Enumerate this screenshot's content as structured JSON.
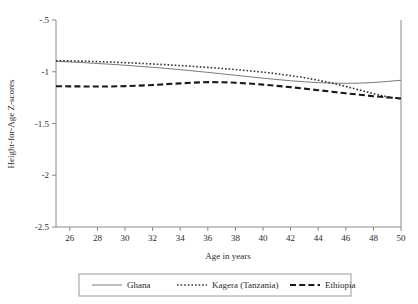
{
  "chart_data": {
    "type": "line",
    "title": "",
    "xlabel": "Age in years",
    "ylabel": "Height-for-Age Z-scores",
    "xlim": [
      25,
      50
    ],
    "ylim": [
      -2.5,
      -0.5
    ],
    "xticks": [
      26,
      28,
      30,
      32,
      34,
      36,
      38,
      40,
      42,
      44,
      46,
      48,
      50
    ],
    "xtick_labels": [
      "26",
      "28",
      "30",
      "32",
      "34",
      "36",
      "38",
      "40",
      "42",
      "44",
      "46",
      "48",
      "50"
    ],
    "yticks": [
      -0.5,
      -1,
      -1.5,
      -2,
      -2.5
    ],
    "ytick_labels": [
      "-.5",
      "-1",
      "-1.5",
      "-2",
      "-2.5"
    ],
    "grid": false,
    "legend_position": "below",
    "x": [
      25,
      26,
      27,
      28,
      29,
      30,
      31,
      32,
      33,
      34,
      35,
      36,
      37,
      38,
      39,
      40,
      41,
      42,
      43,
      44,
      45,
      46,
      47,
      48,
      49,
      50
    ],
    "series": [
      {
        "name": "Ghana",
        "style": "solid",
        "color": "#7a7a7a",
        "values": [
          -0.9,
          -0.905,
          -0.912,
          -0.92,
          -0.928,
          -0.937,
          -0.947,
          -0.957,
          -0.968,
          -0.98,
          -0.993,
          -1.006,
          -1.02,
          -1.034,
          -1.048,
          -1.062,
          -1.075,
          -1.087,
          -1.097,
          -1.105,
          -1.11,
          -1.112,
          -1.11,
          -1.104,
          -1.094,
          -1.082
        ]
      },
      {
        "name": "Kagera (Tanzania)",
        "style": "dotted",
        "color": "#333333",
        "values": [
          -0.893,
          -0.895,
          -0.898,
          -0.902,
          -0.907,
          -0.912,
          -0.918,
          -0.925,
          -0.932,
          -0.94,
          -0.949,
          -0.958,
          -0.968,
          -0.979,
          -0.991,
          -1.004,
          -1.019,
          -1.037,
          -1.058,
          -1.082,
          -1.11,
          -1.142,
          -1.177,
          -1.212,
          -1.242,
          -1.262
        ]
      },
      {
        "name": "Ethiopia",
        "style": "dashed",
        "color": "#1a1a1a",
        "values": [
          -1.14,
          -1.141,
          -1.142,
          -1.143,
          -1.142,
          -1.139,
          -1.134,
          -1.128,
          -1.12,
          -1.112,
          -1.105,
          -1.1,
          -1.101,
          -1.106,
          -1.114,
          -1.124,
          -1.136,
          -1.149,
          -1.163,
          -1.178,
          -1.193,
          -1.208,
          -1.222,
          -1.236,
          -1.248,
          -1.258
        ]
      }
    ],
    "legend_entries": [
      {
        "label": "Ghana",
        "style": "solid"
      },
      {
        "label": "Kagera (Tanzania)",
        "style": "dotted"
      },
      {
        "label": "Ethiopia",
        "style": "dashed"
      }
    ]
  }
}
